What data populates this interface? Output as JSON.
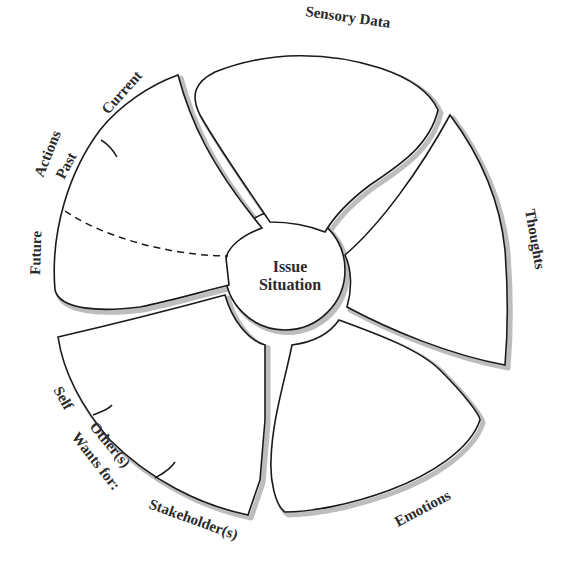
{
  "diagram": {
    "center": {
      "line1": "Issue",
      "line2": "Situation"
    },
    "petals": {
      "actions": {
        "title": "Actions",
        "sub_labels": [
          "Current",
          "Past",
          "Future"
        ]
      },
      "sensory_data": {
        "title": "Sensory Data"
      },
      "thoughts": {
        "title": "Thoughts"
      },
      "emotions": {
        "title": "Emotions"
      },
      "wants": {
        "title": "Wants for:",
        "sub_labels": [
          "Self",
          "Other(s)",
          "Stakeholder(s)"
        ]
      }
    },
    "colors": {
      "outline": "#1a1a1a",
      "shadow": "#bdbdbd",
      "text": "#2a2a2a",
      "background": "#ffffff"
    }
  }
}
